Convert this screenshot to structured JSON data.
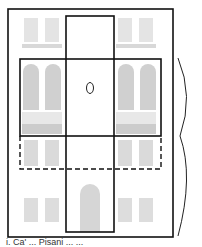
{
  "figure": {
    "type": "facade-diagram",
    "colors": {
      "outline": "#111111",
      "facade_light": "#e6e6e6",
      "facade_mid": "#cfcfcf",
      "background": "#ffffff"
    },
    "regions": {
      "outer_frame": {
        "x": 8,
        "y": 9,
        "w": 165,
        "h": 228,
        "style": "solid"
      },
      "center_column": {
        "x": 66,
        "y": 16,
        "w": 48,
        "h": 216,
        "style": "solid"
      },
      "middle_band": {
        "x": 20,
        "y": 59,
        "w": 141,
        "h": 77,
        "style": "solid"
      },
      "lower_band": {
        "x": 20,
        "y": 136,
        "w": 141,
        "h": 33,
        "style": "dashed"
      }
    },
    "marker": {
      "shape": "oval",
      "cx": 90,
      "cy": 88
    },
    "brace": {
      "side": "right",
      "y_start": 58,
      "y_end": 236,
      "tip_y": 136
    },
    "caption": "i. Ca' ... Pisani ... ..."
  }
}
